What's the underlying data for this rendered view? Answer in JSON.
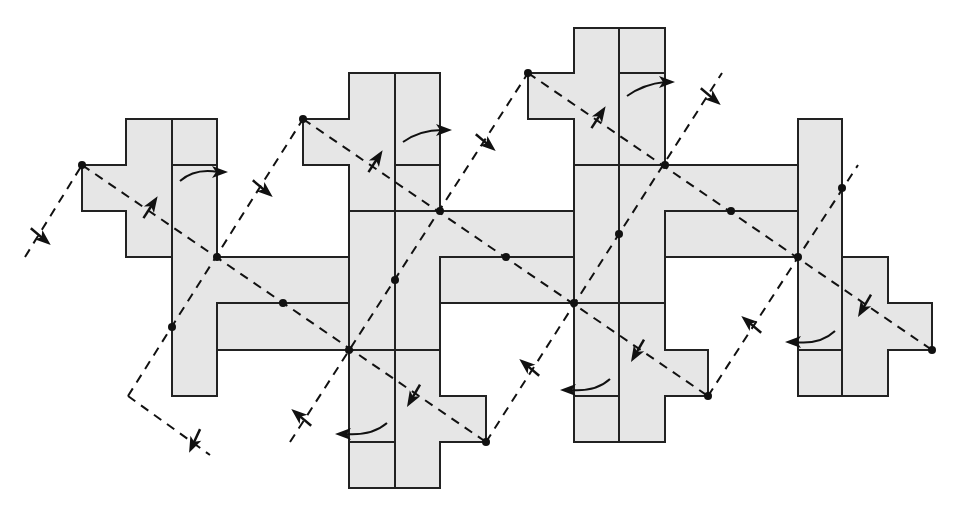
{
  "diagram": {
    "colors": {
      "tile_fill": "#e6e6e6",
      "stroke": "#222222",
      "background": "#ffffff"
    },
    "tiles": [
      {
        "id": "tile-1a",
        "points": "126,119 172,119 172,257 126,257 126,211 82,211 82,165 126,165"
      },
      {
        "id": "tile-1b",
        "points": "172,119 217,119 217,257 349,257 349,303 217,303 217,350 217,396 172,396"
      },
      {
        "id": "tile-1c",
        "points": "217,303 349,303 349,350 217,350"
      },
      {
        "id": "tile-2a",
        "points": "349,73 395,73 395,211 349,211 349,165 303,165 303,119 349,119"
      },
      {
        "id": "tile-2b",
        "points": "395,73 440,73 440,211 574,211 574,257 440,257 440,350 395,350"
      },
      {
        "id": "tile-2c",
        "points": "349,211 395,211 395,350 349,350"
      },
      {
        "id": "tile-2d",
        "points": "440,257 574,257 574,303 440,303"
      },
      {
        "id": "tile-2e",
        "points": "349,350 395,350 395,488 349,488"
      },
      {
        "id": "tile-2f",
        "points": "395,350 440,350 440,396 486,396 486,442 440,442 440,488 395,488"
      },
      {
        "id": "tile-3a",
        "points": "574,28 619,28 619,165 574,165 574,119 528,119 528,73 574,73"
      },
      {
        "id": "tile-3b",
        "points": "619,28 665,28 665,165 798,165 798,211 665,211 665,303 619,303"
      },
      {
        "id": "tile-3c",
        "points": "574,165 619,165 619,303 574,303"
      },
      {
        "id": "tile-3d",
        "points": "665,211 798,211 798,257 665,257"
      },
      {
        "id": "tile-3e",
        "points": "574,303 619,303 619,442 574,442"
      },
      {
        "id": "tile-3f",
        "points": "619,303 665,303 665,350 708,350 708,396 665,396 665,442 619,442"
      },
      {
        "id": "tile-4a",
        "points": "798,119 842,119 842,350 798,350"
      },
      {
        "id": "tile-4b",
        "points": "842,257 888,257 888,303 932,303 932,350 888,350 888,396 842,396"
      },
      {
        "id": "tile-4c",
        "points": "798,350 842,350 842,396 798,396"
      }
    ],
    "seams": [
      "172,119 172,396",
      "172,165 217,165",
      "395,73 395,488",
      "349,211 440,211",
      "349,350 440,350",
      "395,165 440,165",
      "349,442 395,442",
      "619,28 619,442",
      "574,165 665,165",
      "574,303 665,303",
      "619,73 665,73",
      "574,396 619,396",
      "842,119 842,396",
      "798,350 842,350"
    ],
    "glide_axes": [
      "82,165 486,442",
      "303,119 708,396",
      "528,73 932,350"
    ],
    "mirror_lines": [
      "25,257 82,165",
      "128,396 303,119",
      "290,442 528,73",
      "486,442 722,73",
      "708,396 858,165",
      "128,396 210,455"
    ],
    "dots": [
      [
        82,
        165
      ],
      [
        217,
        257
      ],
      [
        283,
        303
      ],
      [
        172,
        327
      ],
      [
        303,
        119
      ],
      [
        440,
        211
      ],
      [
        506,
        257
      ],
      [
        395,
        280
      ],
      [
        349,
        350
      ],
      [
        486,
        442
      ],
      [
        528,
        73
      ],
      [
        665,
        165
      ],
      [
        731,
        211
      ],
      [
        619,
        234
      ],
      [
        574,
        303
      ],
      [
        708,
        396
      ],
      [
        842,
        188
      ],
      [
        798,
        257
      ],
      [
        932,
        350
      ]
    ],
    "arrows": [
      {
        "x": 40,
        "y": 236,
        "angle": 40
      },
      {
        "x": 150,
        "y": 208,
        "angle": -57
      },
      {
        "x": 262,
        "y": 188,
        "angle": 40
      },
      {
        "x": 195,
        "y": 440,
        "angle": 115
      },
      {
        "x": 375,
        "y": 162,
        "angle": -57
      },
      {
        "x": 485,
        "y": 142,
        "angle": 40
      },
      {
        "x": 302,
        "y": 418,
        "angle": -140
      },
      {
        "x": 414,
        "y": 395,
        "angle": 120
      },
      {
        "x": 598,
        "y": 118,
        "angle": -57
      },
      {
        "x": 710,
        "y": 96,
        "angle": 40
      },
      {
        "x": 530,
        "y": 368,
        "angle": -140
      },
      {
        "x": 638,
        "y": 350,
        "angle": 120
      },
      {
        "x": 752,
        "y": 325,
        "angle": -140
      },
      {
        "x": 865,
        "y": 305,
        "angle": 120
      }
    ],
    "rotation_arrows": [
      {
        "d": "M180,181 Q195,168 218,172",
        "head": [
          222,
          172,
          0
        ]
      },
      {
        "d": "M403,142 Q420,130 442,130",
        "head": [
          446,
          130,
          0
        ]
      },
      {
        "d": "M627,96 Q644,84 665,82",
        "head": [
          669,
          82,
          0
        ]
      },
      {
        "d": "M387,423 Q372,436 345,434",
        "head": [
          341,
          434,
          180
        ]
      },
      {
        "d": "M610,379 Q596,392 570,390",
        "head": [
          566,
          390,
          180
        ]
      },
      {
        "d": "M835,331 Q820,345 795,342",
        "head": [
          791,
          342,
          180
        ]
      }
    ]
  }
}
